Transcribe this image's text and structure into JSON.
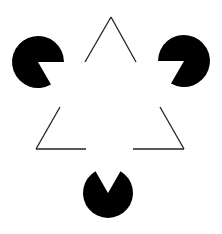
{
  "figure": {
    "width": 222,
    "height": 234,
    "background": "#ffffff",
    "ink": "#000000"
  },
  "pacmen": [
    {
      "name": "top-left",
      "cx": 38,
      "cy": 62,
      "r": 26,
      "mouth_toward": "lower-right"
    },
    {
      "name": "top-right",
      "cx": 184,
      "cy": 61,
      "r": 26,
      "mouth_toward": "lower-left"
    },
    {
      "name": "bottom",
      "cx": 108,
      "cy": 193,
      "r": 25,
      "mouth_toward": "up"
    }
  ],
  "outline_triangle": {
    "apex": [
      111,
      17
    ],
    "bottom_left": [
      36,
      149
    ],
    "bottom_right": [
      184,
      149
    ],
    "stroke_width": 1.3
  }
}
